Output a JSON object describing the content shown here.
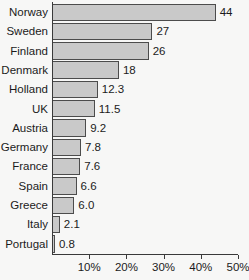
{
  "chart_data": {
    "type": "bar",
    "orientation": "horizontal",
    "title": "",
    "xlabel": "",
    "ylabel": "",
    "xlim": [
      0,
      50
    ],
    "grid": false,
    "legend": null,
    "x_tick_labels": [
      "10%",
      "20%",
      "30%",
      "40%",
      "50%"
    ],
    "x_tick_values": [
      10,
      20,
      30,
      40,
      50
    ],
    "categories": [
      "Norway",
      "Sweden",
      "Finland",
      "Denmark",
      "Holland",
      "UK",
      "Austria",
      "Germany",
      "France",
      "Spain",
      "Greece",
      "Italy",
      "Portugal"
    ],
    "values": [
      44,
      27,
      26,
      18,
      12.3,
      11.5,
      9.2,
      7.8,
      7.6,
      6.6,
      6.0,
      2.1,
      0.8
    ],
    "value_labels": [
      "44",
      "27",
      "26",
      "18",
      "12.3",
      "11.5",
      "9.2",
      "7.8",
      "7.6",
      "6.6",
      "6.0",
      "2.1",
      "0.8"
    ],
    "bar_fill_color": "#c9c9c9",
    "bar_edge_color": "#4c4c4c",
    "axis_color": "#3a3a3a",
    "background_color": "#f7f7f6",
    "text_color": "#1b1b1b"
  }
}
